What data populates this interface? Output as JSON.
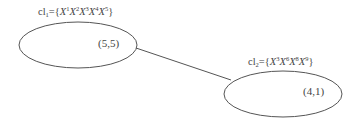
{
  "diagram": {
    "nodes": [
      {
        "id": "cl1",
        "name_base": "cl",
        "name_sub": "1",
        "set_prefix": "={",
        "members": [
          {
            "var": "X",
            "sup": "1"
          },
          {
            "var": "X",
            "sup": "2"
          },
          {
            "var": "X",
            "sup": "3"
          },
          {
            "var": "X",
            "sup": "4"
          },
          {
            "var": "X",
            "sup": "5"
          }
        ],
        "set_suffix": "}",
        "coord": "(5,5)",
        "shape": {
          "cx": 78,
          "cy": 45,
          "rx": 59,
          "ry": 23
        }
      },
      {
        "id": "cl2",
        "name_base": "cl",
        "name_sub": "2",
        "set_prefix": "={",
        "members": [
          {
            "var": "X",
            "sup": "3"
          },
          {
            "var": "X",
            "sup": "6"
          },
          {
            "var": "X",
            "sup": "8"
          },
          {
            "var": "X",
            "sup": "9"
          }
        ],
        "set_suffix": "}",
        "coord": "(4,1)",
        "shape": {
          "cx": 283,
          "cy": 94,
          "rx": 59,
          "ry": 23
        }
      }
    ],
    "edges": [
      {
        "from": "cl1",
        "to": "cl2",
        "x1": 136,
        "y1": 48,
        "x2": 231,
        "y2": 80
      }
    ],
    "colors": {
      "stroke": "#555555",
      "text": "#444444",
      "background": "#ffffff"
    }
  }
}
